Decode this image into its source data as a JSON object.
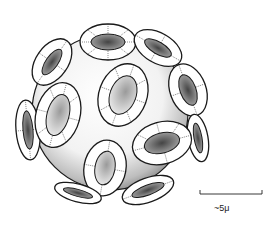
{
  "figure": {
    "colors": {
      "ink": "#1a1a1a",
      "paper": "#ffffff",
      "stipple": "#555555"
    }
  },
  "scale_bar": {
    "label": "~5μ"
  }
}
